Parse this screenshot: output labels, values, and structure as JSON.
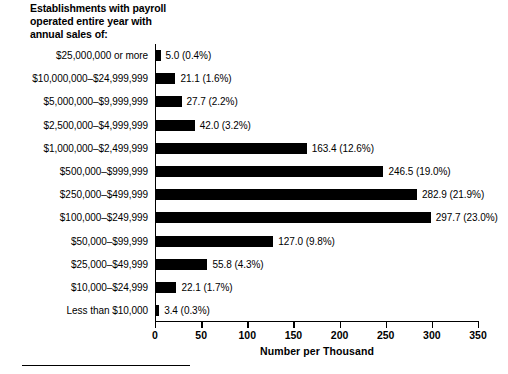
{
  "chart_data": {
    "type": "bar",
    "orientation": "horizontal",
    "title": "Establishments with payroll operated entire year with annual sales of:",
    "title_lines": [
      "Establishments with payroll",
      "operated entire year with",
      "annual sales of:"
    ],
    "xlabel": "Number per Thousand",
    "ylabel": "",
    "xlim": [
      0,
      350
    ],
    "xticks": [
      0,
      50,
      100,
      150,
      200,
      250,
      300,
      350
    ],
    "xtick_labels": [
      "0",
      "50",
      "100",
      "150",
      "200",
      "250",
      "300",
      "350"
    ],
    "grid": false,
    "legend": false,
    "bar_color": "#000000",
    "categories": [
      "$25,000,000 or more",
      "$10,000,000–$24,999,999",
      "$5,000,000–$9,999,999",
      "$2,500,000–$4,999,999",
      "$1,000,000–$2,499,999",
      "$500,000–$999,999",
      "$250,000–$499,999",
      "$100,000–$249,999",
      "$50,000–$99,999",
      "$25,000–$49,999",
      "$10,000–$24,999",
      "Less than $10,000"
    ],
    "values": [
      5.0,
      21.1,
      27.7,
      42.0,
      163.4,
      246.5,
      282.9,
      297.7,
      127.0,
      55.8,
      22.1,
      3.4
    ],
    "percents": [
      0.4,
      1.6,
      2.2,
      3.2,
      12.6,
      19.0,
      21.9,
      23.0,
      9.8,
      4.3,
      1.7,
      0.3
    ],
    "data_labels": [
      "5.0 (0.4%)",
      "21.1 (1.6%)",
      "27.7 (2.2%)",
      "42.0 (3.2%)",
      "163.4 (12.6%)",
      "246.5 (19.0%)",
      "282.9 (21.9%)",
      "297.7 (23.0%)",
      "127.0 (9.8%)",
      "55.8 (4.3%)",
      "22.1 (1.7%)",
      "3.4 (0.3%)"
    ]
  }
}
